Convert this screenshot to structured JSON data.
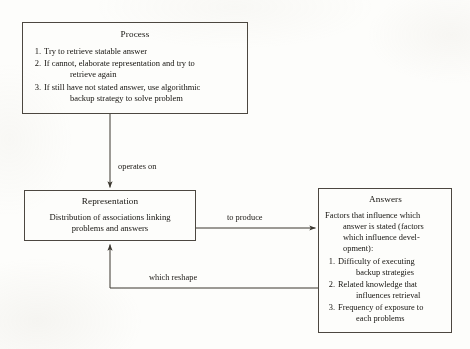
{
  "diagram": {
    "background_color": "#fdfdfb",
    "line_color": "#4c4740",
    "text_color": "#15130f"
  },
  "process_box": {
    "title": "Process",
    "items": [
      {
        "num": "1.",
        "line1": "Try to retrieve statable answer",
        "line2": ""
      },
      {
        "num": "2.",
        "line1": "If cannot, elaborate representation and try to",
        "line2": "retrieve again"
      },
      {
        "num": "3.",
        "line1": "If still have not stated answer, use algorithmic",
        "line2": "backup strategy to solve problem"
      }
    ]
  },
  "representation_box": {
    "title": "Representation",
    "line1": "Distribution of associations linking",
    "line2": "problems and answers"
  },
  "answers_box": {
    "title": "Answers",
    "intro_line1": "Factors that influence which",
    "intro_line2": "answer is stated (factors",
    "intro_line3": "which influence devel-",
    "intro_line4": "opment):",
    "items": [
      {
        "num": "1.",
        "line1": "Difficulty of executing",
        "line2": "backup strategies"
      },
      {
        "num": "2.",
        "line1": "Related knowledge that",
        "line2": "influences retrieval"
      },
      {
        "num": "3.",
        "line1": "Frequency of exposure to",
        "line2": "each problems"
      }
    ]
  },
  "edges": {
    "operates_on": "operates on",
    "to_produce": "to produce",
    "which_reshape": "which reshape"
  }
}
